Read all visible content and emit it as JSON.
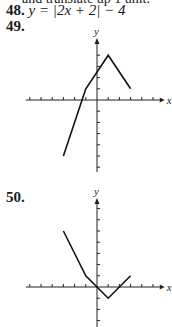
{
  "page": {
    "cut_text": "and translate up 1 unit.",
    "problem_48": {
      "number": "48.",
      "equation": "y = |2x + 2| − 4"
    },
    "problem_49": {
      "number": "49."
    },
    "problem_50": {
      "number": "50."
    },
    "axis_labels": {
      "x": "x",
      "y": "y"
    }
  },
  "chart_data": [
    {
      "type": "line",
      "title": "49.",
      "xlabel": "x",
      "ylabel": "y",
      "x": [
        -3,
        -1,
        1,
        3
      ],
      "series": [
        {
          "name": "graph 49",
          "values": [
            -5,
            1,
            4,
            1
          ]
        }
      ],
      "xlim": [
        -6,
        5
      ],
      "ylim": [
        -6,
        6
      ],
      "grid": false
    },
    {
      "type": "line",
      "title": "50.",
      "xlabel": "x",
      "ylabel": "y",
      "x": [
        -3,
        -1,
        1,
        3
      ],
      "series": [
        {
          "name": "graph 50",
          "values": [
            5,
            1,
            -1,
            1
          ]
        }
      ],
      "xlim": [
        -6,
        5
      ],
      "ylim": [
        -3,
        7
      ],
      "grid": false
    }
  ]
}
